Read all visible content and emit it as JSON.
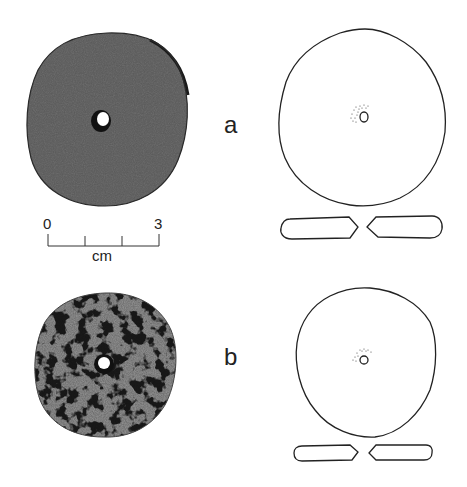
{
  "figure": {
    "objects": [
      {
        "id": "a",
        "label": "a",
        "photo": {
          "description": "perforated stone disc, photograph",
          "tone": "#6b6b6b"
        },
        "drawing": {
          "description": "outline drawing with central perforation and cross-section"
        }
      },
      {
        "id": "b",
        "label": "b",
        "photo": {
          "description": "perforated stone disc with dark encrustations, photograph",
          "tone": "#8a8a8a"
        },
        "drawing": {
          "description": "outline drawing with central perforation and cross-section"
        }
      }
    ],
    "scale_bar": {
      "start_label": "0",
      "end_label": "3",
      "unit": "cm",
      "ticks": 4
    }
  }
}
